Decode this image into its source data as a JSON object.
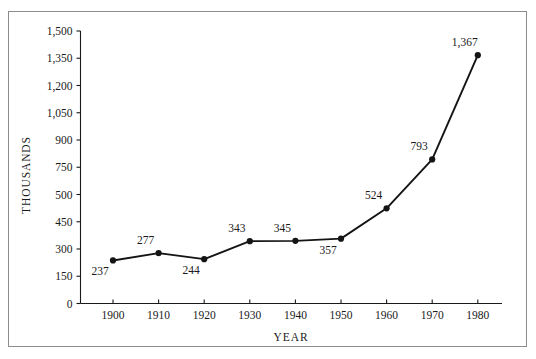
{
  "chart_data": {
    "type": "line",
    "title": "",
    "xlabel": "YEAR",
    "ylabel": "THOUSANDS",
    "x": [
      1900,
      1910,
      1920,
      1930,
      1940,
      1950,
      1960,
      1970,
      1980
    ],
    "values": [
      237,
      277,
      244,
      343,
      345,
      357,
      524,
      793,
      1367
    ],
    "point_labels": [
      "237",
      "277",
      "244",
      "343",
      "345",
      "357",
      "524",
      "793",
      "1,367"
    ],
    "label_positions": [
      "below",
      "above",
      "below",
      "above",
      "above",
      "below",
      "above",
      "above",
      "above"
    ],
    "xtick_labels": [
      "1900",
      "1910",
      "1920",
      "1930",
      "1940",
      "1950",
      "1960",
      "1970",
      "1980"
    ],
    "ytick_values": [
      1500,
      1350,
      1200,
      1050,
      900,
      750,
      500,
      450,
      300,
      150,
      0
    ],
    "ytick_labels": [
      "1,500",
      "1,350",
      "1,200",
      "1,050",
      "900",
      "750",
      "500",
      "450",
      "300",
      "150",
      "0"
    ],
    "xlim": [
      1895,
      1985
    ],
    "ylim": [
      0,
      1500
    ],
    "grid": false,
    "legend": false,
    "line_color": "#141414",
    "marker_color": "#141414",
    "axis_color": "#1a1a1a",
    "border_color": "#8c8c8c",
    "background": "#ffffff"
  }
}
